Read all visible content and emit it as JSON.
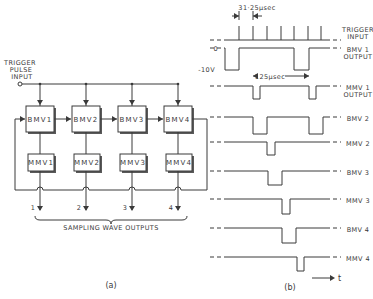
{
  "panel_a": {
    "caption": "(a)",
    "input_label_lines": [
      "TRIGGER",
      "PULSE",
      "INPUT"
    ],
    "bistables": [
      {
        "label": "BMV1",
        "x": 26,
        "y": 106
      },
      {
        "label": "BMV2",
        "x": 72,
        "y": 106
      },
      {
        "label": "BMV3",
        "x": 118,
        "y": 106
      },
      {
        "label": "BMV4",
        "x": 164,
        "y": 106
      }
    ],
    "monostables": [
      {
        "label": "MMV1",
        "x": 28,
        "y": 154
      },
      {
        "label": "MMV2",
        "x": 74,
        "y": 154
      },
      {
        "label": "MMV3",
        "x": 120,
        "y": 154
      },
      {
        "label": "MMV4",
        "x": 166,
        "y": 154
      }
    ],
    "outputs": [
      "1",
      "2",
      "3",
      "4"
    ],
    "outputs_label": "SAMPLING WAVE OUTPUTS"
  },
  "panel_b": {
    "caption": "(b)",
    "period_label": "31·25μsec",
    "cycle_label": "125μsec",
    "level_high": "0",
    "level_low": "-10V",
    "time_axis": "t",
    "trigger": {
      "label_lines": [
        "TRIGGER",
        "INPUT"
      ],
      "baseline_y": 40,
      "top_y": 26,
      "pulses_x": [
        239,
        253,
        267,
        281,
        294,
        308,
        321
      ]
    },
    "waveforms": [
      {
        "name": "bmv1",
        "label_lines": [
          "BMV 1",
          "OUTPUT"
        ],
        "high_y": 48,
        "low_y": 70,
        "lows": [
          [
            225,
            239
          ],
          [
            294,
            309
          ]
        ],
        "start_low": true
      },
      {
        "name": "mmv1",
        "label_lines": [
          "MMV 1",
          "OUTPUT"
        ],
        "high_y": 86,
        "low_y": 99,
        "lows": [
          [
            253,
            260
          ],
          [
            309,
            316
          ]
        ]
      },
      {
        "name": "bmv2",
        "label_lines": [
          "BMV 2"
        ],
        "high_y": 117,
        "low_y": 134,
        "lows": [
          [
            253,
            267
          ],
          [
            309,
            323
          ]
        ]
      },
      {
        "name": "mmv2",
        "label_lines": [
          "MMV 2"
        ],
        "high_y": 142,
        "low_y": 155,
        "lows": [
          [
            267,
            275
          ]
        ]
      },
      {
        "name": "bmv3",
        "label_lines": [
          "BMV 3"
        ],
        "high_y": 171,
        "low_y": 185,
        "lows": [
          [
            268,
            282
          ]
        ]
      },
      {
        "name": "mmv3",
        "label_lines": [
          "MMV 3"
        ],
        "high_y": 199,
        "low_y": 214,
        "lows": [
          [
            282,
            290
          ]
        ]
      },
      {
        "name": "bmv4",
        "label_lines": [
          "BMV 4"
        ],
        "high_y": 228,
        "low_y": 243,
        "lows": [
          [
            282,
            296
          ]
        ]
      },
      {
        "name": "mmv4",
        "label_lines": [
          "MMV 4"
        ],
        "high_y": 257,
        "low_y": 271,
        "lows": [
          [
            297,
            304
          ]
        ]
      }
    ]
  }
}
